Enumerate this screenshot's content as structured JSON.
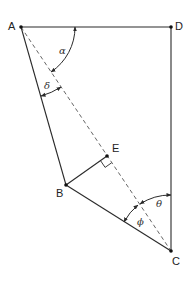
{
  "diagram": {
    "type": "geometry",
    "colors": {
      "line": "#2a2a2a",
      "dashed": "#555555",
      "point": "#111111",
      "text": "#222222"
    },
    "points": {
      "A": {
        "label": "A",
        "x": 21,
        "y": 27
      },
      "B": {
        "label": "B",
        "x": 66,
        "y": 185
      },
      "C": {
        "label": "C",
        "x": 171,
        "y": 251
      },
      "D": {
        "label": "D",
        "x": 171,
        "y": 27
      },
      "E": {
        "label": "E",
        "x": 107,
        "y": 156
      }
    },
    "segments": [
      {
        "from": "A",
        "to": "D",
        "style": "solid"
      },
      {
        "from": "D",
        "to": "C",
        "style": "solid"
      },
      {
        "from": "A",
        "to": "B",
        "style": "solid"
      },
      {
        "from": "B",
        "to": "C",
        "style": "solid"
      },
      {
        "from": "B",
        "to": "E",
        "style": "solid"
      },
      {
        "from": "A",
        "to": "C",
        "style": "dashed"
      }
    ],
    "angles": {
      "alpha": {
        "symbol": "α",
        "vertex": "A",
        "between": [
          "AD",
          "AC"
        ]
      },
      "delta": {
        "symbol": "δ",
        "vertex": "A",
        "between": [
          "AB",
          "AC"
        ]
      },
      "theta": {
        "symbol": "θ",
        "vertex": "C",
        "between": [
          "CD",
          "CA"
        ]
      },
      "phi": {
        "symbol": "ϕ",
        "vertex": "C",
        "between": [
          "CA",
          "CB"
        ]
      }
    },
    "right_angle": {
      "vertex": "E",
      "between": [
        "EB",
        "EC"
      ]
    }
  }
}
